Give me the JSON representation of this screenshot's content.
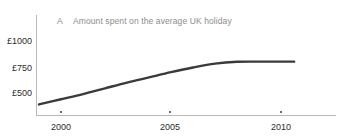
{
  "chart_data": {
    "type": "line",
    "title": "Amount spent on the average UK holiday",
    "panel_label": "A",
    "xlabel": "",
    "ylabel": "",
    "xlim": [
      1999,
      2011
    ],
    "ylim": [
      375,
      1060
    ],
    "grid": false,
    "legend": null,
    "y_tick_labels": [
      "£1000",
      "£750",
      "£500"
    ],
    "y_tick_values": [
      1000,
      750,
      500
    ],
    "x_tick_labels": [
      "2000",
      "2005",
      "2010"
    ],
    "x_tick_values": [
      2000,
      2005,
      2010
    ],
    "series": [
      {
        "name": "Amount spent on the average UK holiday",
        "color": "#3a3a3a",
        "x": [
          1999,
          2000,
          2001,
          2002,
          2003,
          2004,
          2005,
          2006,
          2007,
          2008,
          2009,
          2010,
          2010.6
        ],
        "values": [
          390,
          440,
          490,
          545,
          600,
          650,
          700,
          745,
          782,
          800,
          802,
          802,
          802
        ]
      }
    ]
  },
  "axis_color": "#b9b9b9",
  "title_color": "#8d8d8d",
  "tick_text_color": "#2b2b2b"
}
